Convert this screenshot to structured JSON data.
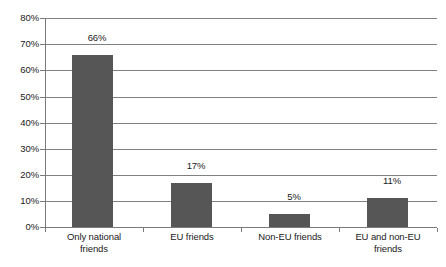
{
  "chart_data": {
    "type": "bar",
    "title": "",
    "subtitle": "",
    "xlabel": "",
    "ylabel": "",
    "categories": [
      "Only national\nfriends",
      "EU friends",
      "Non-EU friends",
      "EU and non-EU\nfriends"
    ],
    "values": [
      66,
      17,
      5,
      11
    ],
    "data_labels": [
      "66%",
      "17%",
      "5%",
      "11%"
    ],
    "ylim": [
      0,
      80
    ],
    "y_ticks": [
      0,
      10,
      20,
      30,
      40,
      50,
      60,
      70,
      80
    ],
    "y_tick_labels": [
      "0%",
      "10%",
      "20%",
      "30%",
      "40%",
      "50%",
      "60%",
      "70%",
      "80%"
    ],
    "grid": true,
    "grid_axis": "y",
    "legend": false,
    "legend_position": "none",
    "bar_color": "#565656",
    "grid_color": "#808080",
    "axis_color": "#7a7a7a",
    "text_color": "#1a1a1a",
    "background_color": "#ffffff"
  }
}
